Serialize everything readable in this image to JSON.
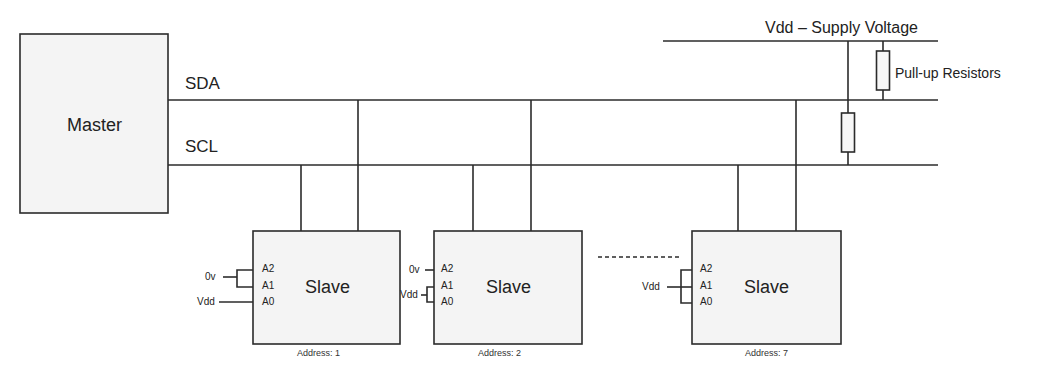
{
  "diagram": {
    "master": {
      "label": "Master"
    },
    "bus": {
      "sda_label": "SDA",
      "scl_label": "SCL"
    },
    "supply": {
      "label": "Vdd – Supply Voltage",
      "resistors_label": "Pull-up Resistors"
    },
    "slaves": [
      {
        "label": "Slave",
        "pins": [
          "A2",
          "A1",
          "A0"
        ],
        "connections": {
          "A2_A1": "0v",
          "A0": "Vdd"
        },
        "address_label": "Address: 1"
      },
      {
        "label": "Slave",
        "pins": [
          "A2",
          "A1",
          "A0"
        ],
        "connections": {
          "A2": "0v",
          "A1_A0": "Vdd"
        },
        "address_label": "Address: 2"
      },
      {
        "label": "Slave",
        "pins": [
          "A2",
          "A1",
          "A0"
        ],
        "connections": {
          "A2_A1_A0": "Vdd"
        },
        "address_label": "Address: 7"
      }
    ],
    "colors": {
      "line": "#2b2b2b",
      "box_fill": "#f4f4f4",
      "background": "#ffffff"
    }
  }
}
